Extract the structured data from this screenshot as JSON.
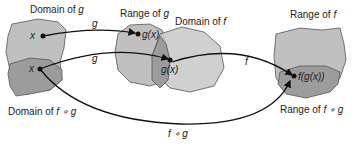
{
  "diagram": {
    "labels": {
      "domain_g": [
        "Domain of ",
        "g"
      ],
      "range_g": [
        "Range of ",
        "g"
      ],
      "domain_f": [
        "Domain of ",
        "f"
      ],
      "range_f": [
        "Range of ",
        "f"
      ],
      "domain_fog": [
        "Domain of ",
        "f ∘ g"
      ],
      "range_fog": [
        "Range of ",
        "f ∘ g"
      ]
    },
    "points": {
      "x_top": "x",
      "x_bottom": "x",
      "gx_top": "g(x)",
      "gx_overlap": "g(x)",
      "fgx": "f(g(x))"
    },
    "arrows": {
      "g_top": "g",
      "g_bottom": "g",
      "f": "f",
      "fog": "f ∘ g"
    },
    "colors": {
      "light_region": "#bdbdbd",
      "dark_region": "#9a9a9a",
      "outline": "#555555",
      "arrow": "#111111"
    }
  }
}
